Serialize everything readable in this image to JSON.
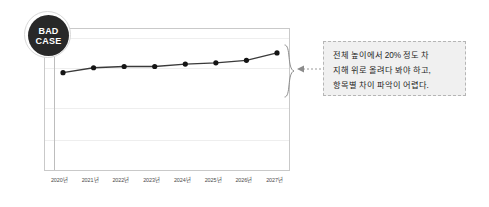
{
  "badge": {
    "name": "bad-case-badge",
    "line1": "BAD",
    "line2": "CASE",
    "bg_color": "#282828",
    "text_color": "#ffffff"
  },
  "callout": {
    "line1": "전체 높이에서 20% 정도 차",
    "line2": "지해 위로 올려다 봐야 하고,",
    "line3": "항목별 차이 파악이 어렵다.",
    "border_color": "#b5b5b5",
    "bg_color": "#f0f0f0"
  },
  "annotations": {
    "brace_label": "range-brace",
    "arrow_label": "dotted-arrow-connector"
  },
  "chart_data": {
    "type": "line",
    "title": "",
    "xlabel": "",
    "ylabel": "",
    "categories": [
      "2020년",
      "2021년",
      "2022년",
      "2023년",
      "2024년",
      "2025년",
      "2026년",
      "2027년"
    ],
    "values": [
      72,
      76,
      77,
      77,
      79,
      80,
      82,
      88
    ],
    "ylim": [
      0,
      100
    ],
    "grid": true,
    "gridlines": [
      100,
      80,
      55,
      33
    ],
    "legend": "none",
    "marker": "circle",
    "line_color": "#3a3a3a",
    "marker_color": "#141414",
    "series": [
      {
        "name": "값",
        "values": [
          72,
          76,
          77,
          77,
          79,
          80,
          82,
          88
        ]
      }
    ]
  }
}
